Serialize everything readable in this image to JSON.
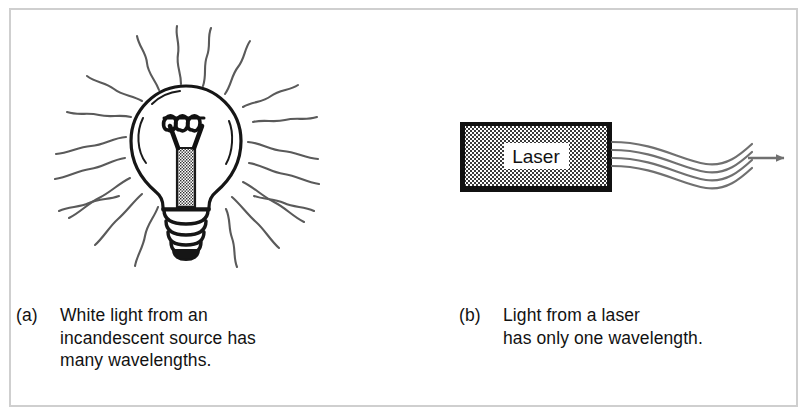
{
  "figure": {
    "kind": "two-panel textbook illustration",
    "frame_color": "#cfcfcf",
    "background_color": "#ffffff",
    "ink_color": "#121212",
    "ray_color": "#5a5a5a",
    "beam_color": "#707070"
  },
  "panel_a": {
    "label": "(a)",
    "subject": "incandescent-light-bulb",
    "caption_lines": [
      "White light from an",
      "incandescent source has",
      "many wavelengths."
    ],
    "bulb": {
      "glass_envelope": "bulb-glass",
      "filament": "bulb-filament",
      "stem": "bulb-stem",
      "screw_base": "bulb-screw-base",
      "ray_count": 20,
      "ray_style": "wavy"
    }
  },
  "panel_b": {
    "label": "(b)",
    "subject": "laser-device",
    "caption_lines": [
      "Light from a laser",
      "has only one wavelength."
    ],
    "device": {
      "body_label": "Laser",
      "body_fill": "stipple",
      "border_color": "#111111",
      "beam_line_count": 4,
      "arrow": "beam-direction-arrow"
    }
  }
}
